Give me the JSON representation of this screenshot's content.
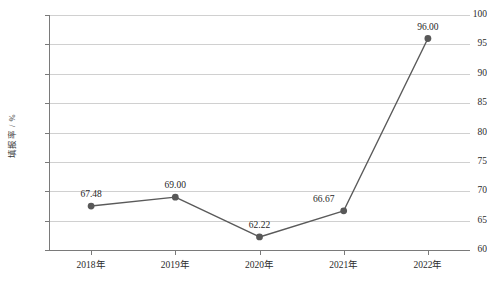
{
  "chart_data": {
    "type": "line",
    "title": "",
    "xlabel": "",
    "ylabel": "填报率 / %",
    "categories": [
      "2018年",
      "2019年",
      "2020年",
      "2021年",
      "2022年"
    ],
    "values": [
      67.48,
      69.0,
      62.22,
      66.67,
      96.0
    ],
    "point_labels": [
      "67.48",
      "69.00",
      "62.22",
      "66.67",
      "96.00"
    ],
    "series": [
      {
        "name": "填报率",
        "values": [
          67.48,
          69.0,
          62.22,
          66.67,
          96.0
        ]
      }
    ],
    "ylim": [
      60,
      100
    ],
    "y_ticks": [
      60,
      65,
      70,
      75,
      80,
      85,
      90,
      95,
      100
    ],
    "y_tick_labels": [
      "60",
      "65",
      "70",
      "75",
      "80",
      "85",
      "90",
      "95",
      "100"
    ],
    "grid": "horizontal",
    "legend": "none",
    "colors": {
      "line": "#5a5a5a",
      "marker": "#585858",
      "grid": "#d0d0d0",
      "axis": "#7a7a7a",
      "text": "#2b2b2b",
      "background": "#ffffff"
    }
  }
}
